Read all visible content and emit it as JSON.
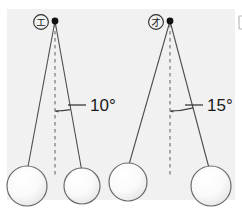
{
  "figure": {
    "background_color": "#f2f2f2",
    "page_color": "#ffffff",
    "line_color": "#4d4d4d",
    "dash_color": "#808080",
    "pivot_color": "#111111",
    "ball_outline_color": "#6b6b6b",
    "ball_fill_light": "#ffffff",
    "ball_fill_shade": "#e6e6e6",
    "text_color": "#1a1a1a"
  },
  "panels": [
    {
      "id": "left",
      "marker_label": "エ",
      "marker_shape": "circled-katakana",
      "angle_label": "10°",
      "angle_degrees": 10,
      "pivot": {
        "x": 55,
        "y": 21
      },
      "dashed_line": {
        "x": 55,
        "y1": 24,
        "y2": 178
      },
      "left_string": {
        "x1": 55,
        "y1": 21,
        "x2": 27,
        "y2": 172
      },
      "right_string": {
        "x1": 55,
        "y1": 21,
        "x2": 82,
        "y2": 172
      },
      "arc": {
        "cx": 55,
        "cy": 21,
        "r": 90
      },
      "balls": [
        {
          "cx": 27,
          "cy": 186,
          "r": 20
        },
        {
          "cx": 82,
          "cy": 186,
          "r": 18
        }
      ],
      "leader": {
        "x1": 68,
        "y1": 105,
        "x2": 86,
        "y2": 105
      },
      "label_pos": {
        "x": 90,
        "y": 111
      }
    },
    {
      "id": "right",
      "marker_label": "オ",
      "marker_shape": "circled-katakana",
      "angle_label": "15°",
      "angle_degrees": 15,
      "pivot": {
        "x": 170,
        "y": 21
      },
      "dashed_line": {
        "x": 170,
        "y1": 24,
        "y2": 178
      },
      "left_string": {
        "x1": 170,
        "y1": 21,
        "x2": 128,
        "y2": 168
      },
      "right_string": {
        "x1": 170,
        "y1": 21,
        "x2": 209,
        "y2": 168
      },
      "arc": {
        "cx": 170,
        "cy": 21,
        "r": 90
      },
      "balls": [
        {
          "cx": 128,
          "cy": 182,
          "r": 19
        },
        {
          "cx": 211,
          "cy": 186,
          "r": 20
        }
      ],
      "leader": {
        "x1": 185,
        "y1": 105,
        "x2": 203,
        "y2": 105
      },
      "label_pos": {
        "x": 207,
        "y": 111
      }
    }
  ],
  "edge_marker": {
    "present": true,
    "description": "partial vertical bracket cropped at right edge",
    "x": 237,
    "y": 16,
    "width": 5,
    "height": 13
  }
}
